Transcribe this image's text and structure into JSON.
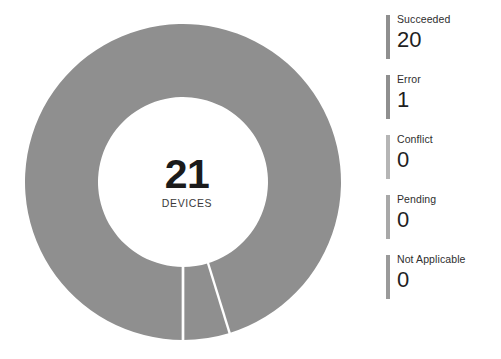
{
  "widget": {
    "name": "Device compliance status donut"
  },
  "center": {
    "total": "21",
    "unit": "DEVICES"
  },
  "colors": {
    "segment": "#8f8f8f",
    "segment_divider": "#ffffff",
    "swatch": "#8f8f8f",
    "label_text": "#2e2e2e",
    "value_text": "#1f1f1f",
    "background": "#ffffff"
  },
  "legend": {
    "items": [
      {
        "label": "Succeeded",
        "value": "20",
        "swatch_color": "#8f8f8f",
        "icon": "legend-bar-icon"
      },
      {
        "label": "Error",
        "value": "1",
        "swatch_color": "#8f8f8f",
        "icon": "legend-bar-icon"
      },
      {
        "label": "Conflict",
        "value": "0",
        "swatch_color": "#b5b5b5",
        "icon": "legend-bar-icon"
      },
      {
        "label": "Pending",
        "value": "0",
        "swatch_color": "#a8a8a8",
        "icon": "legend-bar-icon"
      },
      {
        "label": "Not Applicable",
        "value": "0",
        "swatch_color": "#9a9a9a",
        "icon": "legend-bar-icon"
      }
    ]
  },
  "chart_data": {
    "type": "pie",
    "title": "",
    "subtitle": "",
    "center_text": "21",
    "center_subtext": "DEVICES",
    "total": 21,
    "hole_ratio": 0.53,
    "legend_position": "right",
    "grid": false,
    "categories": [
      "Succeeded",
      "Error",
      "Conflict",
      "Pending",
      "Not Applicable"
    ],
    "values": [
      20,
      1,
      0,
      0,
      0
    ],
    "percentages": [
      95.24,
      4.76,
      0,
      0,
      0
    ],
    "colors": [
      "#8f8f8f",
      "#8f8f8f",
      "#b5b5b5",
      "#a8a8a8",
      "#9a9a9a"
    ],
    "geometry": {
      "center_x": 183,
      "center_y": 182,
      "outer_radius": 158,
      "inner_radius": 85,
      "start_angle_deg": 180,
      "direction": "clockwise",
      "divider_stroke": "#ffffff",
      "divider_width": 2.4
    }
  }
}
